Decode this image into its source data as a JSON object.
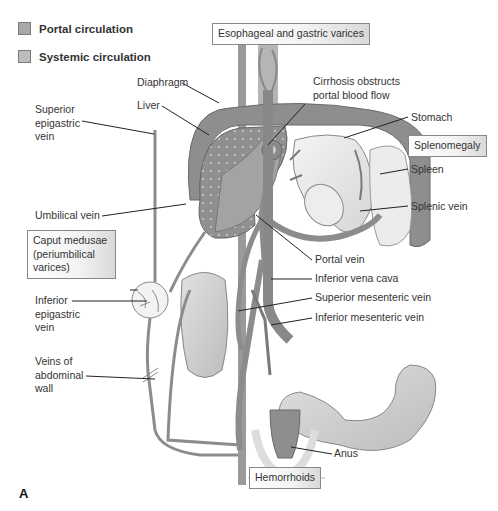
{
  "legend": {
    "items": [
      {
        "label": "Portal circulation",
        "color": "#a8a8a8"
      },
      {
        "label": "Systemic circulation",
        "color": "#bdbdbd"
      }
    ]
  },
  "highlight_boxes": {
    "esophageal": "Esophageal and gastric varices",
    "splenomegaly": "Splenomegaly",
    "caput": [
      "Caput medusae",
      "(periumbilical",
      "varices)"
    ],
    "hemorrhoids": "Hemorrhoids"
  },
  "labels": {
    "diaphragm": "Diaphragm",
    "liver": "Liver",
    "superior_epigastric": [
      "Superior",
      "epigastric",
      "vein"
    ],
    "cirrhosis": [
      "Cirrhosis obstructs",
      "portal blood flow"
    ],
    "stomach": "Stomach",
    "spleen": "Spleen",
    "splenic_vein": "Splenic vein",
    "umbilical_vein": "Umbilical vein",
    "portal_vein": "Portal vein",
    "ivc": "Inferior vena cava",
    "smv": "Superior mesenteric vein",
    "imv": "Inferior mesenteric vein",
    "inferior_epigastric": [
      "Inferior",
      "epigastric",
      "vein"
    ],
    "abdominal_wall": [
      "Veins of",
      "abdominal",
      "wall"
    ],
    "anus": "Anus"
  },
  "panel_letter": "A",
  "colors": {
    "vein": "#8c8c8c",
    "vein_dark": "#6e6e6e",
    "organ_light": "#e4e4e4",
    "organ_mid": "#cfcfcf",
    "liver": "#9a9a9a",
    "leader": "#222222"
  }
}
